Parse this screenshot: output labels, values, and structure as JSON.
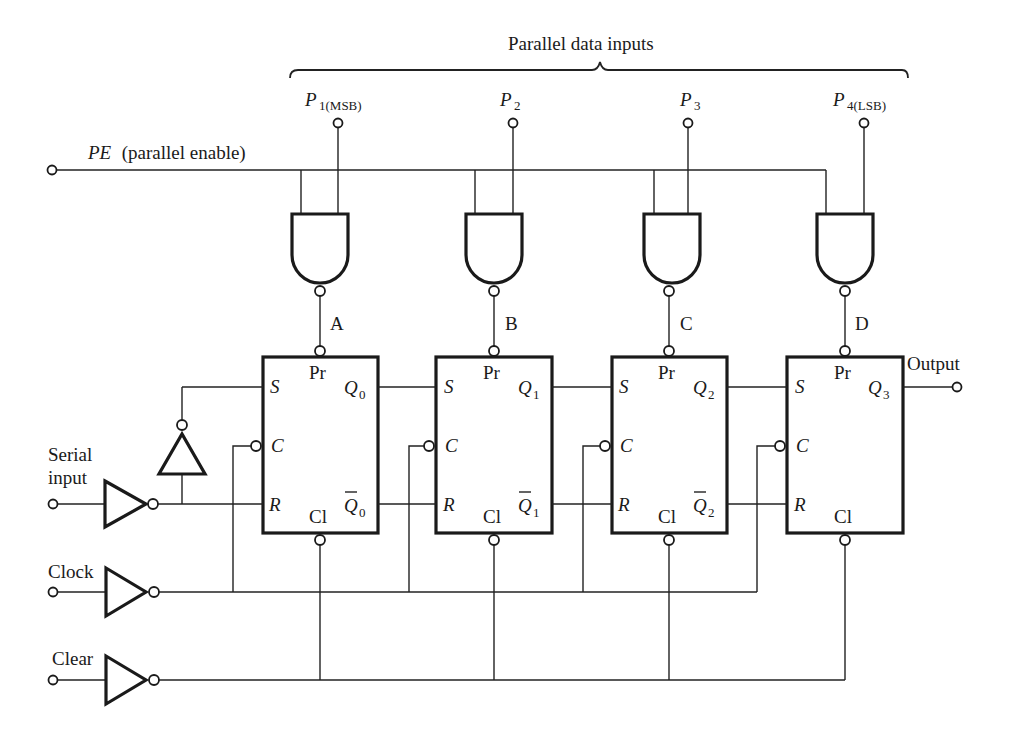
{
  "header": {
    "bracket_label": "Parallel data inputs"
  },
  "parallel_inputs": [
    {
      "name": "P",
      "sub": "1(MSB)"
    },
    {
      "name": "P",
      "sub": "2"
    },
    {
      "name": "P",
      "sub": "3"
    },
    {
      "name": "P",
      "sub": "4(LSB)"
    }
  ],
  "pe": {
    "name": "PE",
    "desc": " (parallel enable)"
  },
  "gate_outputs": [
    "A",
    "B",
    "C",
    "D"
  ],
  "flip_flops": [
    {
      "s": "S",
      "c": "C",
      "r": "R",
      "pr": "Pr",
      "cl": "Cl",
      "q": "Q",
      "q_sub": "0",
      "qbar": "Q",
      "qbar_sub": "0"
    },
    {
      "s": "S",
      "c": "C",
      "r": "R",
      "pr": "Pr",
      "cl": "Cl",
      "q": "Q",
      "q_sub": "1",
      "qbar": "Q",
      "qbar_sub": "1"
    },
    {
      "s": "S",
      "c": "C",
      "r": "R",
      "pr": "Pr",
      "cl": "Cl",
      "q": "Q",
      "q_sub": "2",
      "qbar": "Q",
      "qbar_sub": "2"
    },
    {
      "s": "S",
      "c": "C",
      "r": "R",
      "pr": "Pr",
      "cl": "Cl",
      "q": "Q",
      "q_sub": "3",
      "qbar": "",
      "qbar_sub": ""
    }
  ],
  "inputs": {
    "serial_line1": "Serial",
    "serial_line2": "input",
    "clock": "Clock",
    "clear": "Clear"
  },
  "output": {
    "label": "Output"
  }
}
